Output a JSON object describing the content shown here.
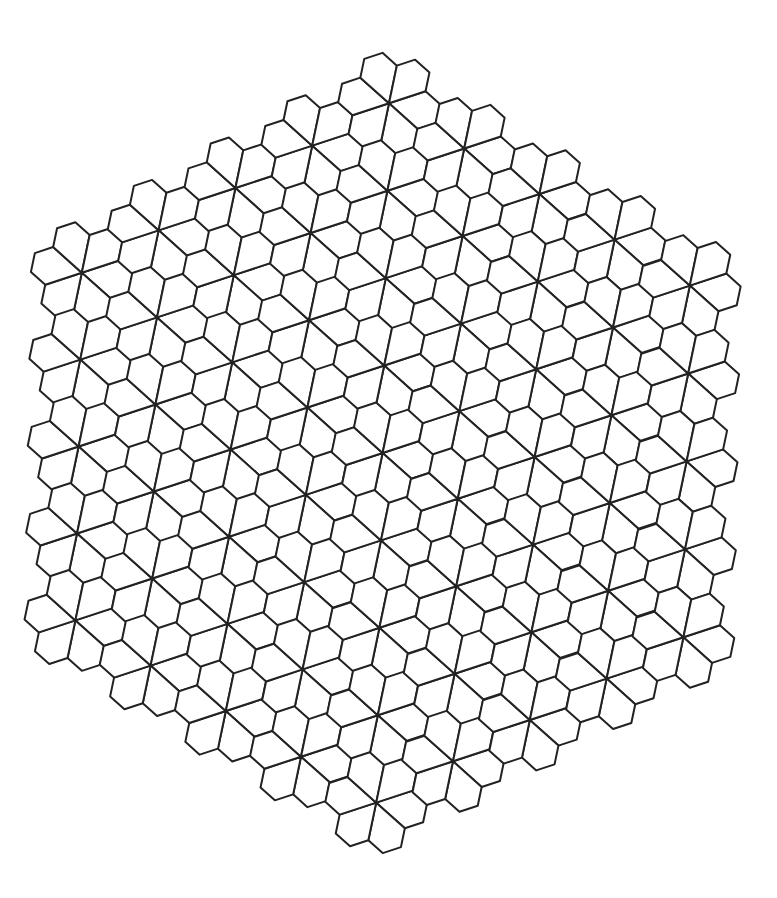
{
  "figure": {
    "tile_shape": "pentagon",
    "petals_per_flower": 6,
    "flowers_per_side": 5,
    "total_flowers": 61,
    "total_pentagons": 366
  },
  "colors": {
    "background": "#ffffff",
    "stroke": "#222222",
    "tile_fill": "#ffffff"
  }
}
